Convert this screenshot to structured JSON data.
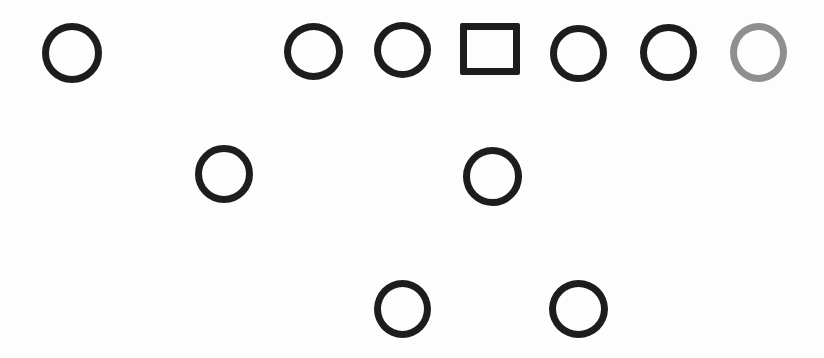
{
  "diagram": {
    "background_color": "#fdfdfd",
    "dark_stroke_color": "#1d1d1d",
    "gray_stroke_color": "#8f8f8f",
    "stroke_width": 7,
    "shapes": [
      {
        "id": "wide-receiver-left",
        "shape": "ellipse",
        "cx": 72,
        "cy": 53,
        "w": 60,
        "h": 60,
        "color": "dark"
      },
      {
        "id": "left-tackle",
        "shape": "ellipse",
        "cx": 313,
        "cy": 51,
        "w": 59,
        "h": 57,
        "color": "dark"
      },
      {
        "id": "left-guard",
        "shape": "ellipse",
        "cx": 402,
        "cy": 50,
        "w": 57,
        "h": 56,
        "color": "dark"
      },
      {
        "id": "center-square",
        "shape": "square",
        "cx": 490,
        "cy": 49,
        "w": 60,
        "h": 52,
        "color": "dark"
      },
      {
        "id": "right-guard",
        "shape": "ellipse",
        "cx": 578,
        "cy": 53,
        "w": 57,
        "h": 57,
        "color": "dark"
      },
      {
        "id": "right-tackle",
        "shape": "ellipse",
        "cx": 668,
        "cy": 52,
        "w": 57,
        "h": 57,
        "color": "dark"
      },
      {
        "id": "tight-end-right-gray",
        "shape": "ellipse",
        "cx": 758,
        "cy": 52,
        "w": 57,
        "h": 59,
        "color": "gray"
      },
      {
        "id": "wing-back-left",
        "shape": "ellipse",
        "cx": 224,
        "cy": 174,
        "w": 58,
        "h": 58,
        "color": "dark"
      },
      {
        "id": "quarterback",
        "shape": "ellipse",
        "cx": 492,
        "cy": 176,
        "w": 59,
        "h": 59,
        "color": "dark"
      },
      {
        "id": "running-back-left",
        "shape": "ellipse",
        "cx": 402,
        "cy": 309,
        "w": 57,
        "h": 58,
        "color": "dark"
      },
      {
        "id": "running-back-right",
        "shape": "ellipse",
        "cx": 578,
        "cy": 309,
        "w": 59,
        "h": 58,
        "color": "dark"
      }
    ]
  }
}
